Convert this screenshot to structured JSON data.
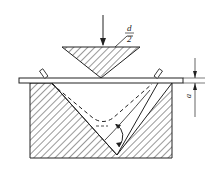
{
  "diagram": {
    "labels": {
      "punch_radius_numerator": "d",
      "punch_radius_denominator": "2",
      "gap": "a"
    },
    "colors": {
      "line": "#222222",
      "hatch": "#333333",
      "background": "#ffffff"
    }
  }
}
